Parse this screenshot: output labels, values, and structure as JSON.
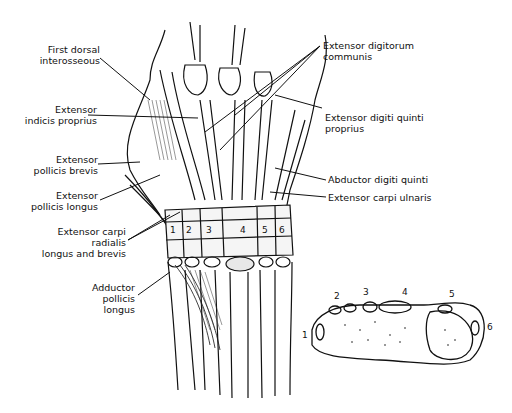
{
  "diagram": {
    "left_labels": [
      {
        "line1": "First dorsal",
        "line2": "interosseous"
      },
      {
        "line1": "Extensor",
        "line2": "indicis proprius"
      },
      {
        "line1": "Extensor",
        "line2": "pollicis brevis"
      },
      {
        "line1": "Extensor",
        "line2": "pollicis longus"
      },
      {
        "line1": "Extensor carpi",
        "line2": "radialis",
        "line3": "longus and brevis"
      },
      {
        "line1": "Adductor",
        "line2": "pollicis",
        "line3": "longus"
      }
    ],
    "right_labels": [
      {
        "line1": "Extensor digitorum",
        "line2": "communis"
      },
      {
        "line1": "Extensor digiti quinti",
        "line2": "proprius"
      },
      {
        "line1": "Abductor digiti quinti"
      },
      {
        "line1": "Extensor carpi ulnaris"
      }
    ],
    "compartments": [
      "1",
      "2",
      "3",
      "4",
      "5",
      "6"
    ],
    "cross_section_numbers": [
      "1",
      "2",
      "3",
      "4",
      "5",
      "6"
    ]
  }
}
